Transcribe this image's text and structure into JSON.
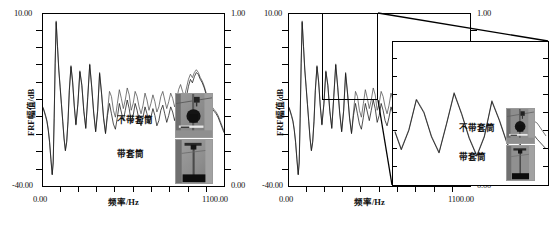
{
  "figure": {
    "title": "",
    "panels": [
      {
        "id": "left-panel",
        "y_axis_label": "FRF幅值/dB",
        "y_max_label": "10.00",
        "y_min_label": "-40.00",
        "x_axis_label": "频率/Hz",
        "x_min_label": "0.00",
        "x_max_label": "1100.00",
        "right_axis_max_label": "1.00",
        "right_axis_min_label": "0.00",
        "legend": [
          {
            "label": "不带套筒"
          },
          {
            "label": "带套筒"
          }
        ]
      },
      {
        "id": "right-panel",
        "y_axis_label": "FRF幅值/dB",
        "y_max_label": "10.00",
        "y_min_label": "-40.00",
        "x_axis_label": "频率/Hz",
        "x_min_label": "0.00",
        "x_max_label": "1100.00",
        "right_axis_max_label": "1.00",
        "right_axis_min_label": "0.00",
        "legend": [
          {
            "label": "不带套筒"
          },
          {
            "label": "带套筒"
          }
        ]
      }
    ]
  },
  "chart_data": [
    {
      "type": "line",
      "id": "left-frf-plot",
      "title": "",
      "xlabel": "频率/Hz",
      "ylabel": "FRF幅值/dB",
      "xlim": [
        0.0,
        1100.0
      ],
      "ylim": [
        -40.0,
        10.0
      ],
      "xticks": [
        0.0,
        1100.0
      ],
      "yticks": [
        -40.0,
        10.0
      ],
      "secondary_y": {
        "label": "",
        "ylim": [
          0.0,
          1.0
        ],
        "yticks": [
          0.0,
          1.0
        ]
      },
      "grid": false,
      "legend_position": "inside-right",
      "series": [
        {
          "name": "不带套筒",
          "color": "#4d4d4d",
          "x": [
            0,
            8,
            16,
            24,
            32,
            40,
            48,
            56,
            62,
            68,
            74,
            80,
            88,
            96,
            104,
            112,
            120,
            128,
            136,
            144,
            152,
            160,
            170,
            180,
            190,
            200,
            212,
            224,
            236,
            248,
            260,
            272,
            284,
            296,
            308,
            320,
            332,
            344,
            356,
            368,
            380,
            392,
            404,
            416,
            428,
            440,
            452,
            464,
            476,
            488,
            500,
            512,
            524,
            536,
            548,
            560,
            572,
            584,
            596,
            608,
            620,
            632,
            644,
            656,
            668,
            680,
            692,
            704,
            716,
            728,
            740,
            752,
            764,
            776,
            788,
            800,
            812,
            824,
            836,
            848,
            860,
            872,
            884,
            896,
            908,
            920,
            932,
            944,
            956,
            968,
            980,
            992,
            1004,
            1016,
            1028,
            1040,
            1052,
            1064,
            1076,
            1088,
            1100
          ],
          "y": [
            -17.0,
            -18.2,
            -19.5,
            -21.0,
            -23.5,
            -27.0,
            -32.0,
            -36.5,
            -33.0,
            -20.0,
            -4.0,
            8.0,
            1.0,
            -6.0,
            -11.0,
            -16.0,
            -21.0,
            -26.0,
            -29.5,
            -27.0,
            -21.0,
            -12.0,
            -5.0,
            -9.5,
            -16.5,
            -22.0,
            -16.0,
            -6.5,
            -10.5,
            -18.0,
            -23.0,
            -14.0,
            -4.5,
            -11.0,
            -18.5,
            -24.0,
            -18.0,
            -7.0,
            -13.0,
            -20.0,
            -24.5,
            -18.5,
            -12.5,
            -14.0,
            -18.0,
            -20.0,
            -16.0,
            -12.0,
            -14.5,
            -17.5,
            -15.0,
            -11.5,
            -13.5,
            -18.0,
            -16.0,
            -12.5,
            -14.0,
            -17.0,
            -19.0,
            -16.5,
            -13.0,
            -15.0,
            -18.0,
            -16.0,
            -13.5,
            -15.5,
            -18.5,
            -17.0,
            -14.0,
            -12.5,
            -15.0,
            -17.5,
            -15.5,
            -13.0,
            -14.5,
            -17.0,
            -15.0,
            -12.0,
            -10.5,
            -12.5,
            -14.0,
            -11.5,
            -9.0,
            -7.5,
            -8.5,
            -7.0,
            -6.2,
            -7.0,
            -8.5,
            -9.5,
            -11.0,
            -13.0,
            -14.5,
            -16.0,
            -17.0,
            -17.8,
            -18.5,
            -19.5,
            -21.0,
            -22.5,
            -24.0
          ]
        },
        {
          "name": "带套筒",
          "color": "#151515",
          "x": [
            0,
            8,
            16,
            24,
            32,
            40,
            48,
            56,
            62,
            68,
            74,
            80,
            88,
            96,
            104,
            112,
            120,
            128,
            136,
            144,
            152,
            160,
            170,
            180,
            190,
            200,
            212,
            224,
            236,
            248,
            260,
            272,
            284,
            296,
            308,
            320,
            332,
            344,
            356,
            368,
            380,
            392,
            404,
            416,
            428,
            440,
            452,
            464,
            476,
            488,
            500,
            512,
            524,
            536,
            548,
            560,
            572,
            584,
            596,
            608,
            620,
            632,
            644,
            656,
            668,
            680,
            692,
            704,
            716,
            728,
            740,
            752,
            764,
            776,
            788,
            800,
            812,
            824,
            836,
            848,
            860,
            872,
            884,
            896,
            908,
            920,
            932,
            944,
            956,
            968,
            980,
            992,
            1004,
            1016,
            1028,
            1040,
            1052,
            1064,
            1076,
            1088,
            1100
          ],
          "y": [
            -17.3,
            -18.5,
            -19.8,
            -21.3,
            -23.8,
            -27.3,
            -32.3,
            -36.8,
            -33.3,
            -20.3,
            -4.3,
            7.6,
            0.6,
            -6.3,
            -11.3,
            -16.3,
            -21.3,
            -26.3,
            -29.8,
            -27.3,
            -21.3,
            -12.3,
            -5.3,
            -9.8,
            -16.8,
            -22.3,
            -16.3,
            -6.8,
            -10.8,
            -18.3,
            -23.3,
            -14.3,
            -4.8,
            -11.3,
            -18.8,
            -24.3,
            -18.3,
            -7.3,
            -13.3,
            -20.3,
            -24.8,
            -19.5,
            -16.0,
            -19.0,
            -22.0,
            -23.5,
            -20.0,
            -16.0,
            -18.5,
            -21.0,
            -18.0,
            -15.0,
            -17.5,
            -21.5,
            -19.5,
            -16.0,
            -18.0,
            -21.0,
            -22.5,
            -20.0,
            -17.0,
            -19.0,
            -22.0,
            -20.0,
            -17.5,
            -19.5,
            -22.5,
            -21.0,
            -18.0,
            -16.5,
            -19.0,
            -21.5,
            -19.5,
            -17.0,
            -18.5,
            -21.0,
            -18.5,
            -15.0,
            -13.0,
            -15.0,
            -16.5,
            -14.0,
            -11.0,
            -9.0,
            -10.0,
            -8.2,
            -7.0,
            -7.6,
            -9.0,
            -10.0,
            -11.5,
            -13.5,
            -15.0,
            -16.5,
            -17.5,
            -18.3,
            -19.0,
            -20.0,
            -21.5,
            -23.0,
            -24.5
          ]
        }
      ]
    },
    {
      "type": "line",
      "id": "right-frf-plot",
      "title": "",
      "xlabel": "频率/Hz",
      "ylabel": "FRF幅值/dB",
      "xlim": [
        0.0,
        1100.0
      ],
      "ylim": [
        -40.0,
        10.0
      ],
      "xticks": [
        0.0,
        1100.0
      ],
      "yticks": [
        -40.0,
        10.0
      ],
      "secondary_y": {
        "label": "",
        "ylim": [
          0.0,
          1.0
        ],
        "yticks": [
          0.0,
          1.0
        ]
      },
      "grid": false,
      "legend_position": "inset",
      "zoom_region": {
        "x": [
          190,
          430
        ],
        "y": [
          -32.0,
          10.0
        ]
      },
      "series": [
        {
          "name": "不带套筒",
          "color": "#4d4d4d",
          "x": [
            0,
            8,
            16,
            24,
            32,
            40,
            48,
            56,
            62,
            68,
            74,
            80,
            88,
            96,
            104,
            112,
            120,
            128,
            136,
            144,
            152,
            160,
            170,
            180,
            190,
            200,
            212,
            224,
            236,
            248,
            260,
            272,
            284,
            296,
            308,
            320,
            332,
            344,
            356,
            368,
            380,
            392,
            404,
            416,
            428,
            440,
            452,
            464,
            476,
            488,
            500,
            512,
            524,
            536,
            548,
            560,
            572,
            584,
            596,
            608,
            620,
            632,
            644,
            656,
            668,
            680,
            692,
            704,
            716,
            728,
            740,
            752,
            764,
            776,
            788,
            800,
            812,
            824,
            836,
            848,
            860,
            872,
            884,
            896,
            908,
            920,
            932,
            944,
            956,
            968,
            980,
            992,
            1004,
            1016,
            1028,
            1040,
            1052,
            1064,
            1076,
            1088,
            1100
          ],
          "y": [
            -17.0,
            -18.2,
            -19.5,
            -21.0,
            -23.5,
            -27.0,
            -32.0,
            -36.5,
            -33.0,
            -20.0,
            -4.0,
            8.0,
            1.0,
            -6.0,
            -11.0,
            -16.0,
            -21.0,
            -26.0,
            -29.5,
            -27.0,
            -21.0,
            -12.0,
            -5.0,
            -9.5,
            -16.5,
            -22.0,
            -16.0,
            -6.5,
            -10.5,
            -18.0,
            -23.0,
            -14.0,
            -4.5,
            -11.0,
            -18.5,
            -24.0,
            -18.0,
            -7.0,
            -13.0,
            -20.0,
            -24.5,
            -18.5,
            -12.5,
            -14.0,
            -18.0,
            -20.0,
            -16.0,
            -12.0,
            -14.5,
            -17.5,
            -15.0,
            -11.5,
            -13.5,
            -18.0,
            -16.0,
            -12.5,
            -14.0,
            -17.0,
            -19.0,
            -16.5,
            -13.0,
            -15.0,
            -18.0,
            -16.0,
            -13.5,
            -15.5,
            -18.5,
            -17.0,
            -14.0,
            -12.5,
            -15.0,
            -17.5,
            -15.5,
            -13.0,
            -14.5,
            -17.0,
            -15.0,
            -12.0,
            -10.5,
            -12.5,
            -14.0,
            -11.5,
            -9.0,
            -7.5,
            -8.5,
            -7.0,
            -6.2,
            -7.0,
            -8.5,
            -9.5,
            -11.0,
            -13.0,
            -14.5,
            -16.0,
            -17.0,
            -17.8,
            -18.5,
            -19.5,
            -21.0,
            -22.5,
            -24.0
          ]
        },
        {
          "name": "带套筒",
          "color": "#151515",
          "x": [
            0,
            8,
            16,
            24,
            32,
            40,
            48,
            56,
            62,
            68,
            74,
            80,
            88,
            96,
            104,
            112,
            120,
            128,
            136,
            144,
            152,
            160,
            170,
            180,
            190,
            200,
            212,
            224,
            236,
            248,
            260,
            272,
            284,
            296,
            308,
            320,
            332,
            344,
            356,
            368,
            380,
            392,
            404,
            416,
            428,
            440,
            452,
            464,
            476,
            488,
            500,
            512,
            524,
            536,
            548,
            560,
            572,
            584,
            596,
            608,
            620,
            632,
            644,
            656,
            668,
            680,
            692,
            704,
            716,
            728,
            740,
            752,
            764,
            776,
            788,
            800,
            812,
            824,
            836,
            848,
            860,
            872,
            884,
            896,
            908,
            920,
            932,
            944,
            956,
            968,
            980,
            992,
            1004,
            1016,
            1028,
            1040,
            1052,
            1064,
            1076,
            1088,
            1100
          ],
          "y": [
            -17.3,
            -18.5,
            -19.8,
            -21.3,
            -23.8,
            -27.3,
            -32.3,
            -36.8,
            -33.3,
            -20.3,
            -4.3,
            7.6,
            0.6,
            -6.3,
            -11.3,
            -16.3,
            -21.3,
            -26.3,
            -29.8,
            -27.3,
            -21.3,
            -12.3,
            -5.3,
            -9.8,
            -16.8,
            -22.3,
            -16.3,
            -6.8,
            -10.8,
            -18.3,
            -23.3,
            -14.3,
            -4.8,
            -11.3,
            -18.8,
            -24.3,
            -18.3,
            -7.3,
            -13.3,
            -20.3,
            -24.8,
            -19.5,
            -16.0,
            -19.0,
            -22.0,
            -23.5,
            -20.0,
            -16.0,
            -18.5,
            -21.0,
            -18.0,
            -15.0,
            -17.5,
            -21.5,
            -19.5,
            -16.0,
            -18.0,
            -21.0,
            -22.5,
            -20.0,
            -17.0,
            -19.0,
            -22.0,
            -20.0,
            -17.5,
            -19.5,
            -22.5,
            -21.0,
            -18.0,
            -16.5,
            -19.0,
            -21.5,
            -19.5,
            -17.0,
            -18.5,
            -21.0,
            -18.5,
            -15.0,
            -13.0,
            -15.0,
            -16.5,
            -14.0,
            -11.0,
            -9.0,
            -10.0,
            -8.2,
            -7.0,
            -7.6,
            -9.0,
            -10.0,
            -11.5,
            -13.5,
            -15.0,
            -16.5,
            -17.5,
            -18.3,
            -19.0,
            -20.0,
            -21.5,
            -23.0,
            -24.5
          ]
        }
      ]
    },
    {
      "type": "line",
      "id": "right-frf-inset",
      "title": "",
      "xlabel": "",
      "ylabel": "",
      "xlim": [
        190.0,
        430.0
      ],
      "ylim": [
        -32.0,
        10.0
      ],
      "grid": false,
      "legend_position": "inside-right",
      "series": [
        {
          "name": "不带套筒",
          "color": "#4d4d4d",
          "x": [
            190,
            200,
            212,
            224,
            236,
            248,
            260,
            272,
            284,
            296,
            308,
            320,
            332,
            344,
            356,
            368,
            380,
            392,
            404,
            416,
            430
          ],
          "y": [
            -16.5,
            -22.0,
            -16.0,
            -6.5,
            -10.5,
            -18.0,
            -23.0,
            -14.0,
            -4.5,
            -11.0,
            -18.5,
            -24.0,
            -18.0,
            -7.0,
            -13.0,
            -20.0,
            -24.5,
            -18.5,
            -12.5,
            -14.0,
            -18.0
          ]
        },
        {
          "name": "带套筒",
          "color": "#151515",
          "x": [
            190,
            200,
            212,
            224,
            236,
            248,
            260,
            272,
            284,
            296,
            308,
            320,
            332,
            344,
            356,
            368,
            380,
            392,
            404,
            416,
            430
          ],
          "y": [
            -16.8,
            -22.3,
            -16.3,
            -6.8,
            -10.8,
            -18.3,
            -23.3,
            -14.3,
            -4.8,
            -11.3,
            -18.8,
            -24.3,
            -18.3,
            -7.3,
            -13.3,
            -20.3,
            -24.8,
            -19.5,
            -16.0,
            -19.0,
            -22.0
          ]
        }
      ]
    }
  ]
}
